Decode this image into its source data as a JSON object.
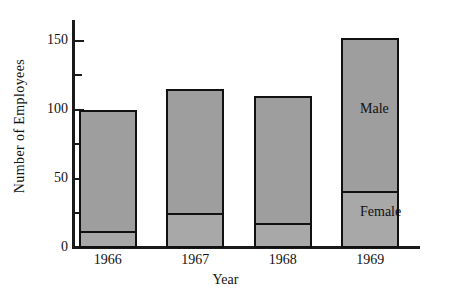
{
  "chart_data": {
    "type": "bar",
    "subtype": "stacked-vertical",
    "title": "",
    "xlabel": "Year",
    "ylabel": "Number of Employees",
    "categories": [
      "1966",
      "1967",
      "1968",
      "1969"
    ],
    "series": [
      {
        "name": "Female",
        "values": [
          11,
          24,
          17,
          40
        ]
      },
      {
        "name": "Male",
        "values": [
          89,
          91,
          93,
          112
        ]
      }
    ],
    "totals": [
      100,
      115,
      110,
      152
    ],
    "ylim": [
      0,
      165
    ],
    "yticks_major": [
      0,
      50,
      100,
      150
    ],
    "ytick_labels": [
      "0",
      "50",
      "100",
      "150"
    ],
    "yticks_minor": [
      25,
      75,
      125
    ],
    "grid": false,
    "legend_position": "inline-right",
    "annotations": [
      {
        "text": "Male",
        "value_at": 100
      },
      {
        "text": "Female",
        "value_at": 25
      }
    ],
    "colors": {
      "bar_fill": "#9e9e9e",
      "bar_outline": "#111111",
      "background": "#ffffff",
      "text": "#111111"
    }
  }
}
